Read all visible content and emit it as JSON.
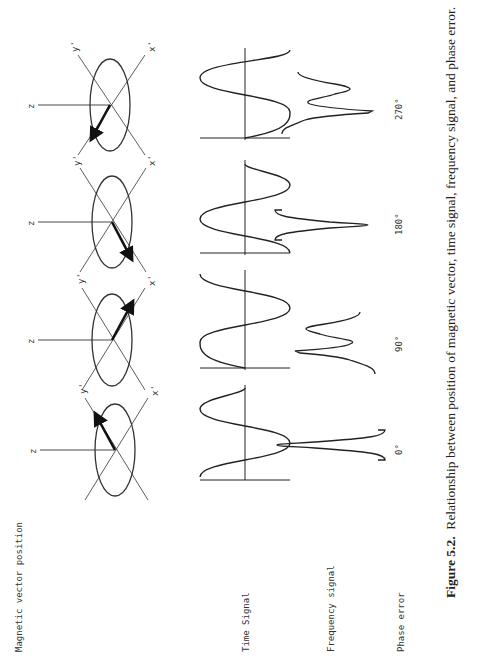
{
  "figure": {
    "row_labels": {
      "vector": "Magnetic vector position",
      "time": "Time Signal",
      "frequency": "Frequency signal",
      "phase": "Phase error"
    },
    "axis_labels": {
      "z": "z",
      "x": "x'",
      "y": "y'"
    },
    "columns": [
      {
        "phase": "0°",
        "vector_direction": "toward y'",
        "time_signal": "cosine",
        "frequency_signal": "absorption (positive peak)"
      },
      {
        "phase": "90°",
        "vector_direction": "toward x'",
        "time_signal": "sine",
        "frequency_signal": "dispersion"
      },
      {
        "phase": "180°",
        "vector_direction": "toward -y'",
        "time_signal": "negative cosine",
        "frequency_signal": "absorption (negative peak)"
      },
      {
        "phase": "270°",
        "vector_direction": "toward -x'",
        "time_signal": "negative sine",
        "frequency_signal": "inverted dispersion"
      }
    ],
    "caption_label": "Figure 5.2.",
    "caption_text": "Relationship between position of magnetic vector, time signal, frequency signal, and phase error."
  }
}
